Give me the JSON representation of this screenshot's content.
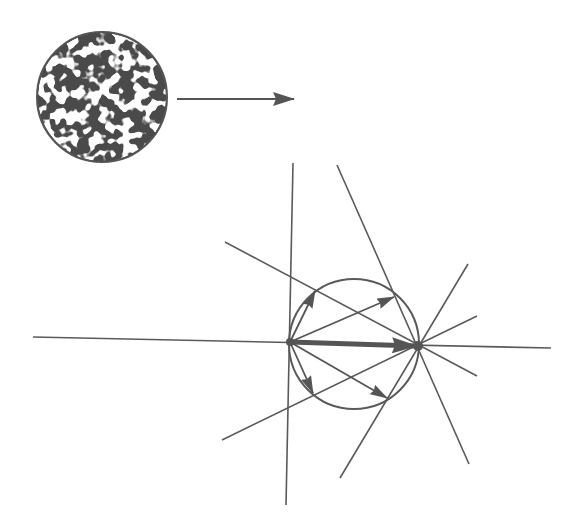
{
  "diagram": {
    "colors": {
      "ink": "#555555",
      "background": "#ffffff",
      "texture_light": "#ffffff"
    },
    "textured_sphere": {
      "cx": 102,
      "cy": 97,
      "r": 65
    },
    "incident_arrow": {
      "x1": 177,
      "y1": 99,
      "x2": 294,
      "y2": 99
    },
    "construction_circle": {
      "cx": 354,
      "cy": 344,
      "r": 65
    },
    "origin_point": {
      "x": 290,
      "y": 342
    },
    "focus_point": {
      "x": 418,
      "y": 346
    },
    "main_vector": {
      "x1": 290,
      "y1": 342,
      "x2": 416,
      "y2": 346
    },
    "scattered_vectors": [
      {
        "x2": 315,
        "y2": 291
      },
      {
        "x2": 394,
        "y2": 297
      },
      {
        "x2": 387,
        "y2": 398
      },
      {
        "x2": 313,
        "y2": 393
      }
    ],
    "lines": [
      {
        "x1": 33,
        "y1": 337,
        "x2": 551,
        "y2": 348
      },
      {
        "x1": 293,
        "y1": 163,
        "x2": 286,
        "y2": 505
      },
      {
        "x1": 225,
        "y1": 242,
        "x2": 477,
        "y2": 376
      },
      {
        "x1": 337,
        "y1": 165,
        "x2": 469,
        "y2": 464
      },
      {
        "x1": 222,
        "y1": 440,
        "x2": 477,
        "y2": 316
      },
      {
        "x1": 340,
        "y1": 478,
        "x2": 468,
        "y2": 264
      }
    ]
  }
}
